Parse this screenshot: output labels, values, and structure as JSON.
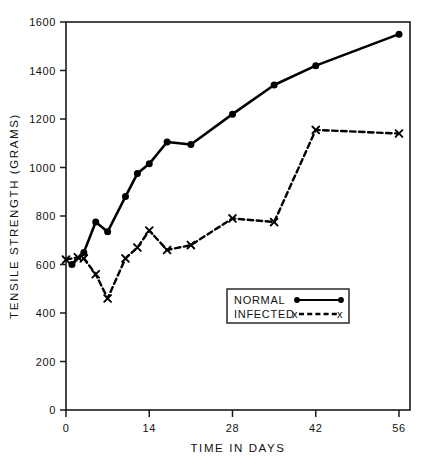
{
  "chart_data": {
    "type": "line",
    "title": "",
    "xlabel": "TIME IN DAYS",
    "ylabel": "TENSILE STRENGTH (GRAMS)",
    "xlim": [
      0,
      58
    ],
    "ylim": [
      0,
      1600
    ],
    "xticks": [
      0,
      14,
      28,
      42,
      56
    ],
    "xtick_labels": [
      "0",
      "14",
      "28",
      "42",
      "56"
    ],
    "yticks": [
      0,
      200,
      400,
      600,
      800,
      1000,
      1200,
      1400,
      1600
    ],
    "ytick_labels": [
      "0",
      "200",
      "400",
      "600",
      "800",
      "1000",
      "1200",
      "1400",
      "1600"
    ],
    "grid": false,
    "legend_position": "center-right-lower",
    "series": [
      {
        "name": "NORMAL",
        "marker": "filled-circle",
        "line_style": "solid",
        "color": "#000000",
        "points": [
          {
            "x": 1,
            "y": 600
          },
          {
            "x": 3,
            "y": 650
          },
          {
            "x": 5,
            "y": 775
          },
          {
            "x": 7,
            "y": 735
          },
          {
            "x": 10,
            "y": 880
          },
          {
            "x": 12,
            "y": 975
          },
          {
            "x": 14,
            "y": 1015
          },
          {
            "x": 17,
            "y": 1105
          },
          {
            "x": 21,
            "y": 1095
          },
          {
            "x": 28,
            "y": 1220
          },
          {
            "x": 35,
            "y": 1340
          },
          {
            "x": 42,
            "y": 1420
          },
          {
            "x": 56,
            "y": 1550
          }
        ]
      },
      {
        "name": "INFECTED",
        "marker": "x",
        "line_style": "dashed",
        "color": "#000000",
        "points": [
          {
            "x": 0,
            "y": 620
          },
          {
            "x": 2,
            "y": 630
          },
          {
            "x": 3,
            "y": 625
          },
          {
            "x": 5,
            "y": 560
          },
          {
            "x": 7,
            "y": 460
          },
          {
            "x": 10,
            "y": 625
          },
          {
            "x": 12,
            "y": 670
          },
          {
            "x": 14,
            "y": 740
          },
          {
            "x": 17,
            "y": 660
          },
          {
            "x": 21,
            "y": 680
          },
          {
            "x": 28,
            "y": 790
          },
          {
            "x": 35,
            "y": 775
          },
          {
            "x": 42,
            "y": 1155
          },
          {
            "x": 56,
            "y": 1140
          }
        ]
      }
    ],
    "legend": [
      {
        "label": "NORMAL",
        "marker": "filled-circle",
        "line_style": "solid"
      },
      {
        "label": "INFECTED",
        "marker": "x",
        "line_style": "dashed"
      }
    ]
  }
}
